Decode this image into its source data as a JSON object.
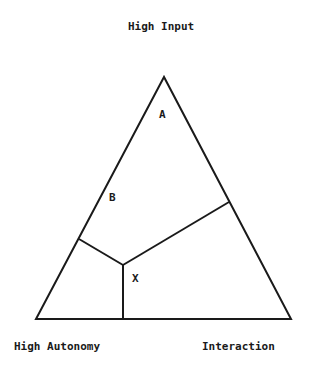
{
  "diagram": {
    "vertex_labels": {
      "top": "High Input",
      "bottom_left": "High Autonomy",
      "bottom_right": "Interaction"
    },
    "region_labels": {
      "a": "A",
      "b": "B",
      "x": "X"
    },
    "colors": {
      "line": "#1a1a1a",
      "background": "#ffffff"
    },
    "geometry": {
      "apex": [
        164,
        77
      ],
      "bottom_left": [
        36,
        319
      ],
      "bottom_right": [
        291,
        319
      ],
      "center": [
        123,
        265
      ],
      "left_junction": [
        79,
        239
      ],
      "right_junction": [
        229,
        202
      ],
      "bottom_junction": [
        123,
        319
      ]
    }
  }
}
